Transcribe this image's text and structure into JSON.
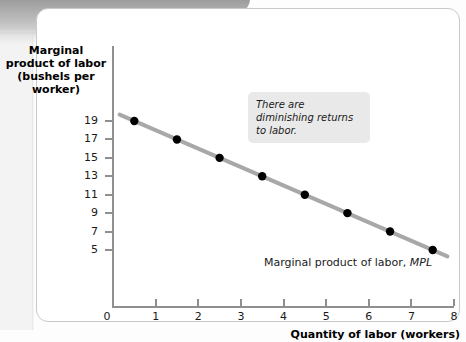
{
  "chart_data": {
    "type": "scatter",
    "title": "",
    "xlabel": "Quantity of labor (workers)",
    "ylabel": "Marginal product of labor (bushels per worker)",
    "ylabel_lines": [
      "Marginal",
      "product of labor",
      "(bushels per",
      "worker)"
    ],
    "xlim": [
      0,
      8
    ],
    "ylim": [
      3,
      20
    ],
    "xticks": [
      0,
      1,
      2,
      3,
      4,
      5,
      6,
      7,
      8
    ],
    "xticklabels": [
      "0",
      "1",
      "2",
      "3",
      "4",
      "5",
      "6",
      "7",
      "8"
    ],
    "yticks": [
      5,
      7,
      9,
      11,
      13,
      15,
      17,
      19
    ],
    "yticklabels": [
      "5",
      "7",
      "9",
      "11",
      "13",
      "15",
      "17",
      "19"
    ],
    "grid": false,
    "legend": "none",
    "series": [
      {
        "name": "Marginal product of labor, MPL",
        "x": [
          0.5,
          1.5,
          2.5,
          3.5,
          4.5,
          5.5,
          6.5,
          7.5
        ],
        "values": [
          19,
          17,
          15,
          13,
          11,
          9,
          7,
          5
        ],
        "marker": "filled-circle",
        "marker_color": "#000000",
        "line_color": "#a8a8a8"
      }
    ],
    "annotations": [
      {
        "name": "diminishing-returns-callout",
        "text": "There are diminishing returns to labor.",
        "style": "italic",
        "background": "#e9e9e9"
      }
    ],
    "series_label_prefix": "Marginal product of labor, ",
    "series_label_italic": "MPL"
  },
  "colors": {
    "line": "#a8a8a8",
    "marker": "#000000",
    "axis": "#8f8f8f",
    "callout_bg": "#e9e9e9",
    "card_border": "#c9c9c9",
    "band": "#b0b0b0"
  }
}
